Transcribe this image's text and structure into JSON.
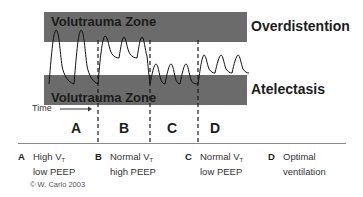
{
  "diagram": {
    "zones": {
      "top_band_label": "Volutrauma Zone",
      "bottom_band_label": "Volutrauma Zone",
      "top_right_label": "Overdistention",
      "bottom_right_label": "Atelectasis",
      "band_color": "#6b6b6b"
    },
    "time": {
      "label": "Time",
      "arrow": "right-arrow"
    },
    "segments": [
      {
        "key": "A",
        "description": "Two tall peaks spanning from lower band to upper band"
      },
      {
        "key": "B",
        "description": "Three peaks reaching upper band with elevated baseline"
      },
      {
        "key": "C",
        "description": "Four small peaks dipping into lower band"
      },
      {
        "key": "D",
        "description": "Three moderate peaks staying between bands"
      }
    ],
    "legend": [
      {
        "key": "A",
        "line1": "High V",
        "sub1": "T",
        "line2": "low PEEP"
      },
      {
        "key": "B",
        "line1": "Normal V",
        "sub1": "T",
        "line2": "high PEEP"
      },
      {
        "key": "C",
        "line1": "Normal V",
        "sub1": "T",
        "line2": "low PEEP"
      },
      {
        "key": "D",
        "line1": "Optimal",
        "sub1": "",
        "line2": "ventilation"
      }
    ],
    "copyright": "© W. Carlo 2003"
  }
}
